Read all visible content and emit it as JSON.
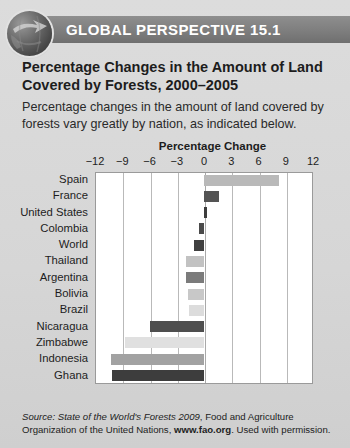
{
  "header": {
    "banner_label": "GLOBAL PERSPECTIVE 15.1",
    "icon": "globe-arrow-icon",
    "banner_color": "#7e7e7e",
    "banner_text_color": "#ffffff"
  },
  "box": {
    "title": "Percentage Changes in the Amount of Land Covered by Forests, 2000–2005",
    "intro": "Percentage changes in the amount of land covered by forests vary greatly by nation, as indicated below."
  },
  "source": {
    "prefix": "Source:",
    "work": "State of the World's Forests 2009",
    "middle": ", Food and Agriculture Organization of the United Nations,",
    "url": "www.fao.org",
    "suffix": ". Used with permission."
  },
  "chart_data": {
    "type": "bar",
    "orientation": "horizontal",
    "title": "Percentage Change",
    "xlabel": "Percentage Change",
    "ylabel": "",
    "xlim": [
      -12,
      12
    ],
    "xticks": [
      -12,
      -9,
      -6,
      -3,
      0,
      3,
      6,
      9,
      12
    ],
    "xtick_labels": [
      "−12",
      "−9",
      "−6",
      "−3",
      "0",
      "3",
      "6",
      "9",
      "12"
    ],
    "grid": true,
    "legend": false,
    "categories": [
      "Spain",
      "France",
      "United States",
      "Colombia",
      "World",
      "Thailand",
      "Argentina",
      "Bolivia",
      "Brazil",
      "Nicaragua",
      "Zimbabwe",
      "Indonesia",
      "Ghana"
    ],
    "values": [
      8.3,
      1.7,
      0.3,
      -0.5,
      -1.1,
      -2.0,
      -2.0,
      -1.8,
      -1.7,
      -6.0,
      -8.7,
      -10.2,
      -10.1
    ],
    "bar_colors": [
      "#b9b9b9",
      "#545454",
      "#3c3c3c",
      "#4a4a4a",
      "#3f3f3f",
      "#c2c2c2",
      "#7b7b7b",
      "#c8c8c8",
      "#dcdcdc",
      "#4e4e4e",
      "#e0e0e0",
      "#a2a2a2",
      "#3d3d3d"
    ]
  }
}
